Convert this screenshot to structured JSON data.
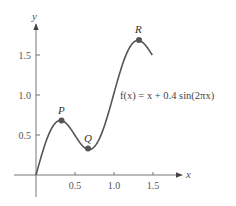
{
  "chart_data": {
    "type": "line",
    "title": "",
    "function_label": "f(x) = x + 0.4 sin(2πx)",
    "xlabel": "x",
    "ylabel": "y",
    "xlim": [
      0,
      1.6
    ],
    "ylim": [
      -0.2,
      1.9
    ],
    "x_ticks": [
      0.5,
      1.0,
      1.5
    ],
    "x_tick_labels": [
      "0.5",
      "1.0",
      "1.5"
    ],
    "y_ticks": [
      0.5,
      1.0,
      1.5
    ],
    "y_tick_labels": [
      "0.5",
      "1.0",
      "1.5"
    ],
    "grid": false,
    "series": [
      {
        "name": "f(x) = x + 0.4 sin(2πx)",
        "domain": [
          0,
          1.5
        ],
        "x": [
          0,
          0.1,
          0.2,
          0.3,
          0.33,
          0.4,
          0.5,
          0.6,
          0.67,
          0.7,
          0.8,
          0.9,
          1.0,
          1.1,
          1.2,
          1.3,
          1.33,
          1.4,
          1.5
        ],
        "y": [
          0,
          0.335,
          0.58,
          0.68,
          0.68,
          0.635,
          0.5,
          0.365,
          0.32,
          0.32,
          0.42,
          0.665,
          1.0,
          1.335,
          1.58,
          1.68,
          1.68,
          1.635,
          1.5
        ],
        "color": "#555555"
      }
    ],
    "annotations": [
      {
        "label": "P",
        "x": 0.33,
        "y": 0.68,
        "type": "local-max"
      },
      {
        "label": "Q",
        "x": 0.67,
        "y": 0.32,
        "type": "local-min"
      },
      {
        "label": "R",
        "x": 1.33,
        "y": 1.68,
        "type": "local-max"
      }
    ]
  },
  "labels": {
    "x_axis": "x",
    "y_axis": "y",
    "formula": "f(x) = x + 0.4 sin(2πx)",
    "P": "P",
    "Q": "Q",
    "R": "R",
    "xt0": "0.5",
    "xt1": "1.0",
    "xt2": "1.5",
    "yt0": "0.5",
    "yt1": "1.0",
    "yt2": "1.5"
  },
  "colors": {
    "axis": "#666666",
    "curve": "#555555",
    "point": "#555555"
  }
}
